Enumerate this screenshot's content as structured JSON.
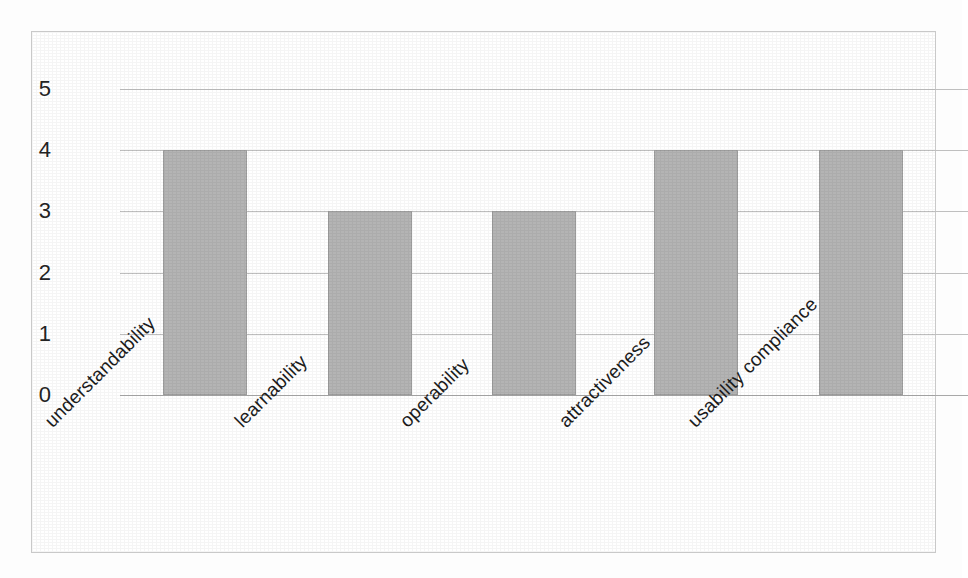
{
  "chart_data": {
    "type": "bar",
    "title": "",
    "subtitle": "",
    "xlabel": "",
    "ylabel": "",
    "categories": [
      "understandability",
      "learnability",
      "operability",
      "attractiveness",
      "usability compliance"
    ],
    "values": [
      4,
      3,
      3,
      4,
      4
    ],
    "ylim": [
      0,
      5
    ],
    "y_ticks": [
      5,
      4,
      3,
      2,
      1,
      0
    ],
    "y_tick_labels": [
      "5",
      "4",
      "3",
      "2",
      "1",
      "0"
    ],
    "grid": true,
    "grid_axis": "y",
    "legend": false,
    "legend_position": "none",
    "annotations": [],
    "series": [
      {
        "name": "rating",
        "values": [
          4,
          3,
          3,
          4,
          4
        ]
      }
    ]
  },
  "style": {
    "bar_fill": "#b4b4b4",
    "bar_border": "#9d9d9d",
    "gridline_color": "#bfbfbf",
    "baseline_color": "#a8a8a8",
    "frame_border": "#c9c9c9",
    "background": "#ffffff",
    "text_color": "#1c1c1c",
    "label_rotation_degrees": -45
  }
}
